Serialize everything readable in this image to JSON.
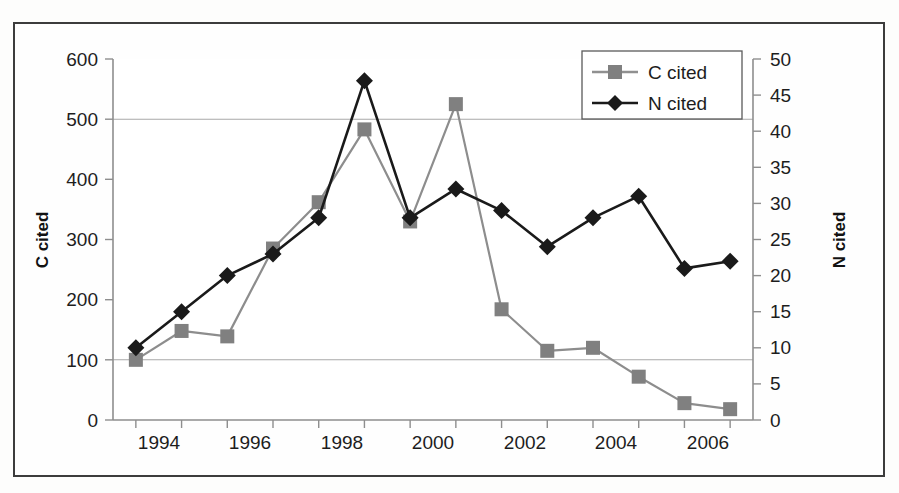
{
  "figure": {
    "background_color": "#fdfdfc",
    "frame_color": "#3c3c3c",
    "plot_background": "#ffffff"
  },
  "axes": {
    "left": {
      "title": "C cited",
      "ticks": [
        "0",
        "100",
        "200",
        "300",
        "400",
        "500",
        "600"
      ],
      "min": 0,
      "max": 600,
      "step": 100
    },
    "right": {
      "title": "N cited",
      "ticks": [
        "0",
        "5",
        "10",
        "15",
        "20",
        "25",
        "30",
        "35",
        "40",
        "45",
        "50"
      ],
      "min": 0,
      "max": 50,
      "step": 5
    },
    "bottom": {
      "title": "",
      "ticks": [
        "1994",
        "1996",
        "1998",
        "2000",
        "2002",
        "2004",
        "2006"
      ]
    }
  },
  "legend": {
    "position": "top-right-inside",
    "entries": [
      {
        "label": "C cited",
        "marker": "square",
        "color": "#808080"
      },
      {
        "label": "N cited",
        "marker": "diamond",
        "color": "#1a1a1a"
      }
    ]
  },
  "chart_data": {
    "type": "line",
    "title": "",
    "xlabel": "",
    "ylabel": "C cited",
    "y2label": "N cited",
    "grid": true,
    "legend_position": "top-right-inside",
    "x": [
      1994,
      1995,
      1996,
      1997,
      1998,
      1999,
      2000,
      2001,
      2002,
      2003,
      2004,
      2005,
      2006,
      2007
    ],
    "xlim": [
      1993.5,
      2007.5
    ],
    "ylim": [
      0,
      600
    ],
    "y2lim": [
      0,
      50
    ],
    "series": [
      {
        "name": "C cited",
        "axis": "left",
        "color": "#808080",
        "marker": "square",
        "values": [
          100,
          148,
          139,
          285,
          362,
          483,
          330,
          525,
          184,
          115,
          120,
          72,
          28,
          18
        ]
      },
      {
        "name": "N cited",
        "axis": "right",
        "color": "#1a1a1a",
        "marker": "diamond",
        "values": [
          10,
          15,
          20,
          23,
          28,
          47,
          28,
          32,
          29,
          24,
          28,
          31,
          21,
          22
        ]
      }
    ]
  }
}
